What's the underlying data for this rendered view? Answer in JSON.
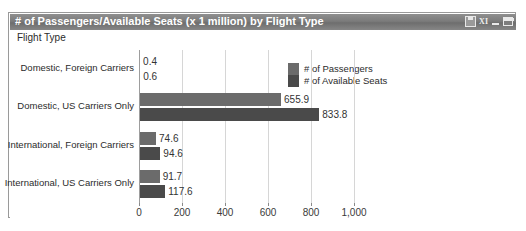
{
  "window": {
    "title": "# of Passengers/Available Seats (x 1 million) by Flight Type",
    "buttons": [
      {
        "name": "save-icon",
        "label": ""
      },
      {
        "name": "excel-export-icon",
        "label": "XI"
      },
      {
        "name": "minimize-icon",
        "label": ""
      },
      {
        "name": "maximize-icon",
        "label": ""
      }
    ]
  },
  "chart_data": {
    "type": "bar",
    "orientation": "horizontal",
    "title": "# of Passengers/Available Seats (x 1 million) by Flight Type",
    "xlabel": "",
    "ylabel": "Flight Type",
    "categories": [
      "Domestic, Foreign Carriers",
      "Domestic, US Carriers Only",
      "International, Foreign Carriers",
      "International, US Carriers Only"
    ],
    "series": [
      {
        "name": "# of Passengers",
        "color": "#6b6b6b",
        "values": [
          0.4,
          655.9,
          74.6,
          91.7
        ],
        "labels": [
          "0.4",
          "655.9",
          "74.6",
          "91.7"
        ]
      },
      {
        "name": "# of Available Seats",
        "color": "#4a4a4a",
        "values": [
          0.6,
          833.8,
          94.6,
          117.6
        ],
        "labels": [
          "0.6",
          "833.8",
          "94.6",
          "117.6"
        ]
      }
    ],
    "xlim": [
      0,
      1000
    ],
    "xticks": [
      0,
      200,
      400,
      600,
      800,
      1000
    ],
    "xtick_labels": [
      "0",
      "200",
      "400",
      "600",
      "800",
      "1,000"
    ],
    "grid": true,
    "legend_position": "right",
    "data_labels": true
  }
}
